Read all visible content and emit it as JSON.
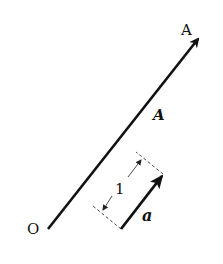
{
  "diagram": {
    "type": "vector-diagram",
    "labels": {
      "origin": "O",
      "point_a": "A",
      "vector_big": "A",
      "vector_unit": "a",
      "unit_length": "1"
    },
    "colors": {
      "stroke": "#111111",
      "dashed": "#333333",
      "background": "#ffffff"
    }
  }
}
